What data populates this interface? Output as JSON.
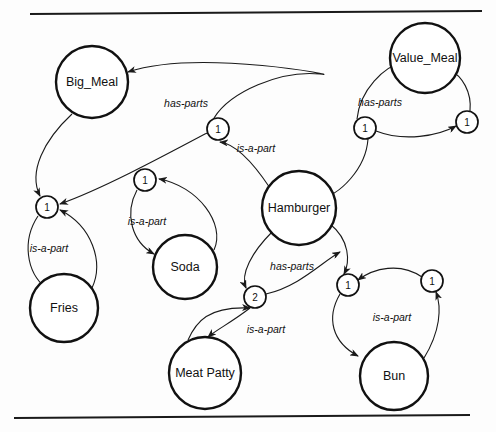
{
  "diagram": {
    "background_color": "#fdfdfd",
    "stroke_color": "#111111",
    "rules": [
      {
        "name": "top-rule",
        "x1": 30,
        "y1": 14,
        "x2": 482,
        "y2": 11
      },
      {
        "name": "bottom-rule",
        "x1": 14,
        "y1": 418,
        "x2": 470,
        "y2": 415
      }
    ],
    "entities": [
      {
        "id": "big_meal",
        "label": "Big_Meal",
        "cx": 92,
        "cy": 82,
        "r": 36
      },
      {
        "id": "value_meal",
        "label": "Value_Meal",
        "cx": 425,
        "cy": 58,
        "r": 35
      },
      {
        "id": "hamburger",
        "label": "Hamburger",
        "cx": 299,
        "cy": 208,
        "r": 37
      },
      {
        "id": "soda",
        "label": "Soda",
        "cx": 185,
        "cy": 267,
        "r": 32
      },
      {
        "id": "fries",
        "label": "Fries",
        "cx": 64,
        "cy": 308,
        "r": 34
      },
      {
        "id": "meat_patty",
        "label": "Meat Patty",
        "cx": 205,
        "cy": 373,
        "r": 36
      },
      {
        "id": "bun",
        "label": "Bun",
        "cx": 394,
        "cy": 376,
        "r": 34
      }
    ],
    "cardinalities": [
      {
        "id": "card_fries",
        "label": "1",
        "cx": 47,
        "cy": 207,
        "r": 11
      },
      {
        "id": "card_soda",
        "label": "1",
        "cx": 145,
        "cy": 180,
        "r": 11
      },
      {
        "id": "card_bigmeal",
        "label": "1",
        "cx": 218,
        "cy": 129,
        "r": 11
      },
      {
        "id": "card_valuemeal",
        "label": "1",
        "cx": 365,
        "cy": 128,
        "r": 11
      },
      {
        "id": "card_vm_right",
        "label": "1",
        "cx": 467,
        "cy": 122,
        "r": 11
      },
      {
        "id": "card_meatpatty",
        "label": "2",
        "cx": 255,
        "cy": 297,
        "r": 11
      },
      {
        "id": "card_bun",
        "label": "1",
        "cx": 348,
        "cy": 285,
        "r": 11
      },
      {
        "id": "card_bun_right",
        "label": "1",
        "cx": 432,
        "cy": 281,
        "r": 11
      }
    ],
    "edges": [
      {
        "id": "e1",
        "from": "card_bigmeal",
        "to": "big_meal",
        "relation": "has-parts",
        "path": "M 214 118 C 230 92 280 70 320 74 C 350 78 200 48 128 72",
        "label_x": 186,
        "label_y": 104
      },
      {
        "id": "e2",
        "from": "big_meal",
        "to": "card_fries",
        "relation": "",
        "path": "M 72 114 C 44 140 28 172 40 196",
        "label_x": 0,
        "label_y": 0
      },
      {
        "id": "e3",
        "from": "card_bigmeal",
        "to": "card_fries",
        "relation": "",
        "path": "M 207 133 C 160 158 100 190 60 204",
        "label_x": 0,
        "label_y": 0
      },
      {
        "id": "e4",
        "from": "card_fries",
        "to": "fries",
        "relation": "is-a-part",
        "path": "M 38 216 C 22 240 26 272 46 288",
        "label_x": 49,
        "label_y": 249
      },
      {
        "id": "e5",
        "from": "fries",
        "to": "card_fries",
        "relation": "",
        "path": "M 92 288 C 104 262 92 226 60 210",
        "label_x": 0,
        "label_y": 0
      },
      {
        "id": "e6",
        "from": "card_soda",
        "to": "soda",
        "relation": "is-a-part",
        "path": "M 137 190 C 124 214 132 242 154 254",
        "label_x": 147,
        "label_y": 222
      },
      {
        "id": "e7",
        "from": "soda",
        "to": "card_soda",
        "relation": "",
        "path": "M 214 250 C 226 224 198 186 159 179",
        "label_x": 0,
        "label_y": 0
      },
      {
        "id": "e8",
        "from": "hamburger",
        "to": "card_bigmeal",
        "relation": "is-a-part",
        "path": "M 270 188 C 254 164 236 144 220 142",
        "label_x": 256,
        "label_y": 149
      },
      {
        "id": "e9",
        "from": "card_valuemeal",
        "to": "hamburger",
        "relation": "",
        "path": "M 368 139 C 366 168 340 196 318 199",
        "label_x": 0,
        "label_y": 0
      },
      {
        "id": "e10",
        "from": "card_valuemeal",
        "to": "value_meal",
        "relation": "has-parts",
        "path": "M 357 119 C 360 90 384 66 404 62",
        "label_x": 380,
        "label_y": 103
      },
      {
        "id": "e11",
        "from": "card_vm_right",
        "to": "value_meal",
        "relation": "",
        "path": "M 470 111 C 472 92 462 76 450 70",
        "label_x": 0,
        "label_y": 0
      },
      {
        "id": "e12",
        "from": "card_valuemeal",
        "to": "card_vm_right",
        "relation": "",
        "path": "M 376 131 C 404 142 438 136 456 126",
        "label_x": 0,
        "label_y": 0
      },
      {
        "id": "e13",
        "from": "hamburger",
        "to": "card_meatpatty",
        "relation": "has-parts",
        "path": "M 272 232 C 252 252 240 274 246 288",
        "label_x": 292,
        "label_y": 267
      },
      {
        "id": "e14",
        "from": "card_meatpatty",
        "to": "card_bun",
        "relation": "",
        "path": "M 266 294 C 300 286 322 262 340 252",
        "label_x": 0,
        "label_y": 0
      },
      {
        "id": "e15",
        "from": "hamburger",
        "to": "card_bun",
        "relation": "",
        "path": "M 330 224 C 350 240 350 262 344 274",
        "label_x": 0,
        "label_y": 0
      },
      {
        "id": "e16",
        "from": "meat_patty",
        "to": "card_meatpatty",
        "relation": "is-a-part",
        "path": "M 188 340 C 196 322 208 306 250 308",
        "label_x": 266,
        "label_y": 330
      },
      {
        "id": "e17",
        "from": "card_meatpatty",
        "to": "meat_patty",
        "relation": "",
        "path": "M 250 308 C 232 322 216 330 208 337",
        "label_x": 0,
        "label_y": 0
      },
      {
        "id": "e18",
        "from": "card_bun",
        "to": "bun",
        "relation": "is-a-part",
        "path": "M 340 294 C 326 318 332 342 358 356",
        "label_x": 392,
        "label_y": 318
      },
      {
        "id": "e19",
        "from": "bun",
        "to": "card_bun_right",
        "relation": "",
        "path": "M 424 358 C 440 332 442 308 436 292",
        "label_x": 0,
        "label_y": 0
      },
      {
        "id": "e20",
        "from": "card_bun_right",
        "to": "card_bun",
        "relation": "",
        "path": "M 422 277 C 400 262 374 268 358 280",
        "label_x": 0,
        "label_y": 0
      }
    ],
    "relations_legend": {
      "has_parts": "has-parts",
      "is_a_part": "is-a-part"
    }
  }
}
